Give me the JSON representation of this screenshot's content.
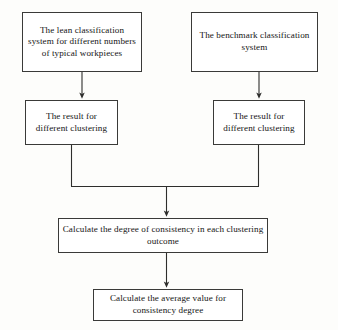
{
  "diagram": {
    "background_color": "#fdfdfb",
    "border_color": "#3a3a38",
    "text_color": "#141414",
    "nodes": [
      {
        "id": "lean-system",
        "label": "The lean classification system for different numbers of typical workpieces"
      },
      {
        "id": "benchmark-system",
        "label": "The benchmark classification system"
      },
      {
        "id": "result-left",
        "label": "The result for different clustering"
      },
      {
        "id": "result-right",
        "label": "The result for different clustering"
      },
      {
        "id": "degree-consistency",
        "label": "Calculate the degree of consistency in each clustering outcome"
      },
      {
        "id": "average-value",
        "label": "Calculate the average value for consistency degree"
      }
    ],
    "edges": [
      {
        "id": "lean-to-result-left",
        "from": "lean-system",
        "to": "result-left",
        "style": "arrow-down"
      },
      {
        "id": "benchmark-to-result-right",
        "from": "benchmark-system",
        "to": "result-right",
        "style": "arrow-down"
      },
      {
        "id": "result-left-to-merge",
        "from": "result-left",
        "to": "merge-bar",
        "style": "line-down"
      },
      {
        "id": "result-right-to-merge",
        "from": "result-right",
        "to": "merge-bar",
        "style": "line-down"
      },
      {
        "id": "merge-to-degree",
        "from": "merge-bar",
        "to": "degree-consistency",
        "style": "arrow-down"
      },
      {
        "id": "degree-to-average",
        "from": "degree-consistency",
        "to": "average-value",
        "style": "arrow-down"
      }
    ]
  }
}
